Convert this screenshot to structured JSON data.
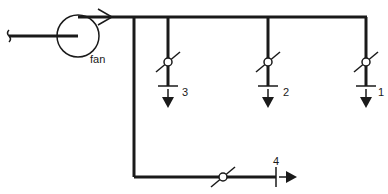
{
  "diagram": {
    "type": "ventilation duct schematic",
    "fan": {
      "label": "fan",
      "icon": "fan-circle-icon"
    },
    "outlets": [
      {
        "id": "1",
        "label": "1"
      },
      {
        "id": "2",
        "label": "2"
      },
      {
        "id": "3",
        "label": "3"
      },
      {
        "id": "4",
        "label": "4"
      }
    ],
    "colors": {
      "line": "#1a1a1a",
      "background": "#ffffff"
    }
  }
}
